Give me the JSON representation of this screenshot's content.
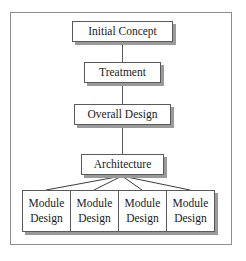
{
  "diagram": {
    "accent_color": "#5a5a5a",
    "shadow_color": "#9a9a9a",
    "frame_color": "#8d8d8d",
    "text_color": "#1b1b1b",
    "background": "#ffffff",
    "nodes": [
      {
        "id": "initial-concept",
        "label": "Initial Concept"
      },
      {
        "id": "treatment",
        "label": "Treatment"
      },
      {
        "id": "overall-design",
        "label": "Overall Design"
      },
      {
        "id": "architecture",
        "label": "Architecture"
      }
    ],
    "modules": [
      {
        "line1": "Module",
        "line2": "Design"
      },
      {
        "line1": "Module",
        "line2": "Design"
      },
      {
        "line1": "Module",
        "line2": "Design"
      },
      {
        "line1": "Module",
        "line2": "Design"
      }
    ]
  }
}
